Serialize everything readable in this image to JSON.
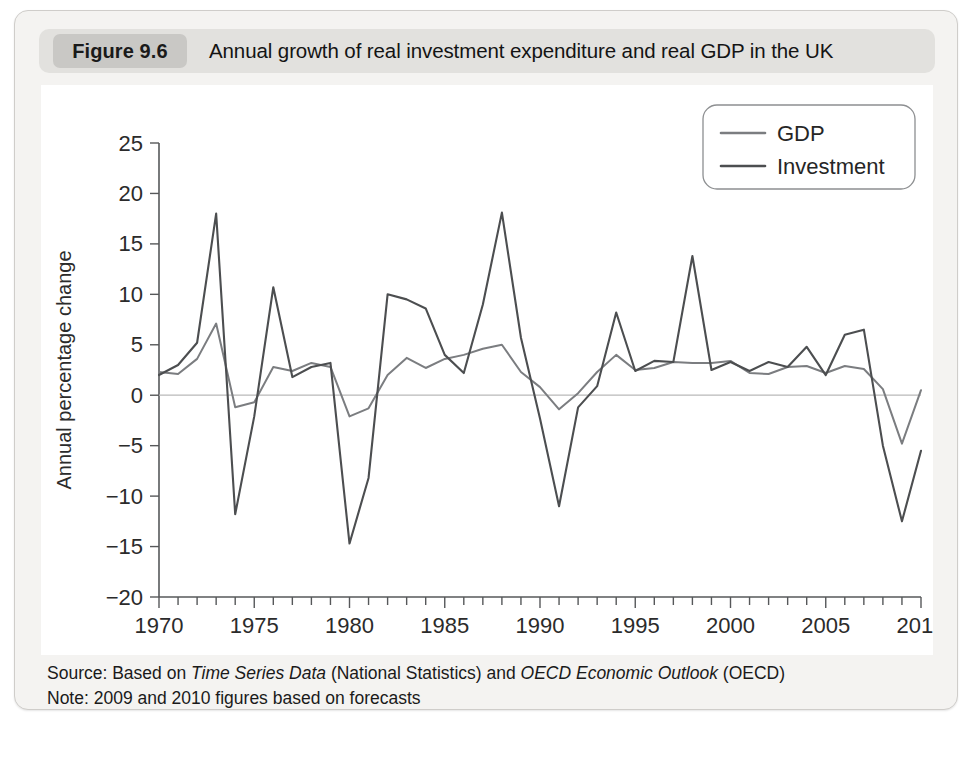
{
  "figure": {
    "number_label": "Figure 9.6",
    "title": "Annual growth of real investment expenditure and real GDP in the UK",
    "source_prefix": "Source: Based on ",
    "source_italic_1": "Time Series Data",
    "source_mid": " (National Statistics) and ",
    "source_italic_2": "OECD Economic Outlook",
    "source_suffix": " (OECD)",
    "note": "Note: 2009 and 2010 figures based on forecasts"
  },
  "colors": {
    "gdp_line": "#7b7d80",
    "investment_line": "#4c4e50",
    "panel_background": "#f4f3f1",
    "header_bar": "#e2e1de",
    "figure_pill": "#c9c8c5",
    "plot_background": "#ffffff",
    "axis": "#56585a",
    "zero_line": "#b9b9b9"
  },
  "chart_data": {
    "type": "line",
    "title": "Annual growth of real investment expenditure and real GDP in the UK",
    "xlabel": "",
    "ylabel": "Annual percentage change",
    "xlim": [
      1970,
      2010
    ],
    "ylim": [
      -20,
      25
    ],
    "ytick_values": [
      25,
      20,
      15,
      10,
      5,
      0,
      -5,
      -10,
      -15,
      -20
    ],
    "ytick_labels": [
      "25",
      "20",
      "15",
      "10",
      "5",
      "0",
      "−5",
      "−10",
      "−15",
      "−20"
    ],
    "xtick_values": [
      1970,
      1975,
      1980,
      1985,
      1990,
      1995,
      2000,
      2005,
      2010
    ],
    "xtick_labels": [
      "1970",
      "1975",
      "1980",
      "1985",
      "1990",
      "1995",
      "2000",
      "2005",
      "2010"
    ],
    "minor_xticks_every": 1,
    "grid": false,
    "zero_line": true,
    "legend_position": "top-right",
    "x": [
      1970,
      1971,
      1972,
      1973,
      1974,
      1975,
      1976,
      1977,
      1978,
      1979,
      1980,
      1981,
      1982,
      1983,
      1984,
      1985,
      1986,
      1987,
      1988,
      1989,
      1990,
      1991,
      1992,
      1993,
      1994,
      1995,
      1996,
      1997,
      1998,
      1999,
      2000,
      2001,
      2002,
      2003,
      2004,
      2005,
      2006,
      2007,
      2008,
      2009,
      2010
    ],
    "series": [
      {
        "name": "GDP",
        "color": "#7b7d80",
        "values": [
          2.3,
          2.1,
          3.6,
          7.1,
          -1.2,
          -0.7,
          2.8,
          2.4,
          3.2,
          2.8,
          -2.1,
          -1.3,
          2.0,
          3.7,
          2.7,
          3.6,
          4.0,
          4.6,
          5.0,
          2.3,
          0.8,
          -1.4,
          0.2,
          2.3,
          4.0,
          2.5,
          2.7,
          3.3,
          3.2,
          3.2,
          3.4,
          2.2,
          2.1,
          2.8,
          2.9,
          2.2,
          2.9,
          2.6,
          0.6,
          -4.8,
          0.5
        ]
      },
      {
        "name": "Investment",
        "color": "#4c4e50",
        "values": [
          2.0,
          3.0,
          5.2,
          18.0,
          -11.8,
          -2.1,
          10.7,
          1.8,
          2.8,
          3.2,
          -14.7,
          -8.2,
          10.0,
          9.5,
          8.6,
          4.0,
          2.2,
          9.0,
          18.1,
          5.7,
          -2.3,
          -11.0,
          -1.2,
          0.9,
          8.2,
          2.4,
          3.4,
          3.3,
          13.8,
          2.5,
          3.3,
          2.4,
          3.3,
          2.8,
          4.8,
          2.0,
          6.0,
          6.5,
          -5.0,
          -12.5,
          -5.5
        ]
      }
    ],
    "legend_entries": [
      "GDP",
      "Investment"
    ]
  }
}
